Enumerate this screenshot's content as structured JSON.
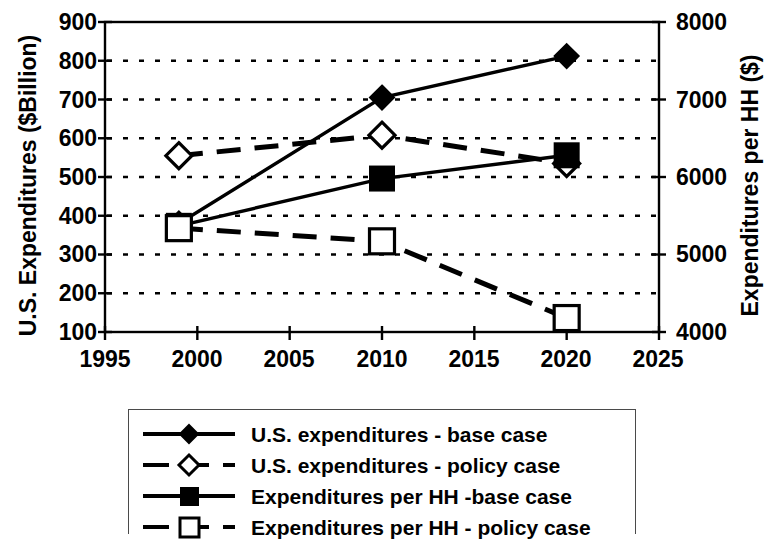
{
  "chart_data": {
    "type": "line",
    "title": "",
    "xlabel": "",
    "ylabel": "U.S. Expenditures ($Billion)",
    "y2label": "Expenditures per HH ($)",
    "x": [
      1999,
      2010,
      2020
    ],
    "xlim": [
      1995,
      2025
    ],
    "xticks": [
      1995,
      2000,
      2005,
      2010,
      2015,
      2020,
      2025
    ],
    "ylim": [
      100,
      900
    ],
    "yticks": [
      100,
      200,
      300,
      400,
      500,
      600,
      700,
      800,
      900
    ],
    "y2lim": [
      4000,
      8000
    ],
    "y2ticks": [
      4000,
      5000,
      6000,
      7000,
      8000
    ],
    "y2ticks_minor": [
      4500,
      5500,
      6500,
      7500
    ],
    "grid": "horizontal-dotted",
    "legend_position": "below",
    "series": [
      {
        "name": "U.S. expenditures - base case",
        "axis": "left",
        "marker": "filled-diamond",
        "linestyle": "solid",
        "values": [
          380,
          705,
          812
        ]
      },
      {
        "name": "U.S. expenditures - policy case",
        "axis": "left",
        "marker": "open-diamond",
        "linestyle": "dashed",
        "values": [
          555,
          608,
          535
        ]
      },
      {
        "name": "Expenditures per HH -base case",
        "axis": "right",
        "marker": "filled-square",
        "linestyle": "solid",
        "values": [
          5370,
          5980,
          6280
        ]
      },
      {
        "name": "Expenditures per HH - policy case",
        "axis": "right",
        "marker": "open-square",
        "linestyle": "dashed",
        "values": [
          5340,
          5170,
          4180
        ]
      }
    ],
    "colors": {
      "line": "#000000",
      "axis": "#000000",
      "grid": "#000000",
      "background": "#ffffff"
    }
  },
  "axes": {
    "left_title": "U.S. Expenditures ($Billion)",
    "right_title": "Expenditures per HH ($)",
    "left_ticks": [
      "900",
      "800",
      "700",
      "600",
      "500",
      "400",
      "300",
      "200",
      "100"
    ],
    "right_ticks": [
      "8000",
      "7000",
      "6000",
      "5000",
      "4000"
    ],
    "x_ticks": [
      "1995",
      "2000",
      "2005",
      "2010",
      "2015",
      "2020",
      "2025"
    ]
  },
  "legend": {
    "items": [
      {
        "label": "U.S. expenditures - base case",
        "marker": "filled-diamond",
        "line": "solid"
      },
      {
        "label": "U.S. expenditures - policy case",
        "marker": "open-diamond",
        "line": "dashed"
      },
      {
        "label": "Expenditures per HH -base case",
        "marker": "filled-square",
        "line": "solid"
      },
      {
        "label": "Expenditures per HH - policy case",
        "marker": "open-square",
        "line": "dashed"
      }
    ]
  }
}
